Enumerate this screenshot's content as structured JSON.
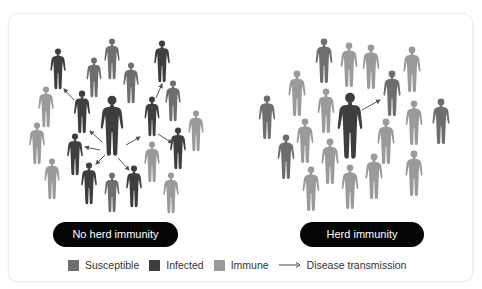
{
  "colors": {
    "susceptible": "#6e6e6e",
    "infected": "#3e3e3e",
    "immune": "#9a9a9a",
    "arrow": "#555555",
    "pill_bg": "#050505",
    "pill_text": "#ffffff"
  },
  "panels": [
    {
      "label": "No herd immunity",
      "figures": [
        {
          "x": 58,
          "y": 48,
          "h": 42,
          "type": "infected"
        },
        {
          "x": 94,
          "y": 57,
          "h": 41,
          "type": "susceptible"
        },
        {
          "x": 112,
          "y": 38,
          "h": 42,
          "type": "susceptible"
        },
        {
          "x": 131,
          "y": 62,
          "h": 42,
          "type": "susceptible"
        },
        {
          "x": 162,
          "y": 40,
          "h": 43,
          "type": "infected"
        },
        {
          "x": 173,
          "y": 80,
          "h": 42,
          "type": "susceptible"
        },
        {
          "x": 46,
          "y": 86,
          "h": 42,
          "type": "immune"
        },
        {
          "x": 82,
          "y": 90,
          "h": 44,
          "type": "infected"
        },
        {
          "x": 112,
          "y": 95,
          "h": 62,
          "type": "infected"
        },
        {
          "x": 152,
          "y": 96,
          "h": 41,
          "type": "infected"
        },
        {
          "x": 196,
          "y": 110,
          "h": 42,
          "type": "immune"
        },
        {
          "x": 37,
          "y": 122,
          "h": 43,
          "type": "immune"
        },
        {
          "x": 75,
          "y": 133,
          "h": 43,
          "type": "infected"
        },
        {
          "x": 178,
          "y": 127,
          "h": 43,
          "type": "infected"
        },
        {
          "x": 152,
          "y": 141,
          "h": 42,
          "type": "immune"
        },
        {
          "x": 52,
          "y": 158,
          "h": 42,
          "type": "immune"
        },
        {
          "x": 89,
          "y": 162,
          "h": 43,
          "type": "infected"
        },
        {
          "x": 112,
          "y": 172,
          "h": 41,
          "type": "susceptible"
        },
        {
          "x": 134,
          "y": 165,
          "h": 43,
          "type": "infected"
        },
        {
          "x": 171,
          "y": 172,
          "h": 42,
          "type": "immune"
        }
      ],
      "arrows": [
        {
          "x1": 74,
          "y1": 100,
          "x2": 64,
          "y2": 89
        },
        {
          "x1": 102,
          "y1": 142,
          "x2": 90,
          "y2": 131
        },
        {
          "x1": 100,
          "y1": 150,
          "x2": 85,
          "y2": 147
        },
        {
          "x1": 105,
          "y1": 155,
          "x2": 96,
          "y2": 164
        },
        {
          "x1": 118,
          "y1": 158,
          "x2": 129,
          "y2": 170
        },
        {
          "x1": 126,
          "y1": 145,
          "x2": 140,
          "y2": 137
        },
        {
          "x1": 156,
          "y1": 98,
          "x2": 162,
          "y2": 84
        },
        {
          "x1": 158,
          "y1": 134,
          "x2": 172,
          "y2": 143
        }
      ]
    },
    {
      "label": "Herd immunity",
      "figures": [
        {
          "x": 324,
          "y": 38,
          "h": 46,
          "type": "susceptible"
        },
        {
          "x": 349,
          "y": 42,
          "h": 46,
          "type": "immune"
        },
        {
          "x": 371,
          "y": 44,
          "h": 46,
          "type": "immune"
        },
        {
          "x": 412,
          "y": 46,
          "h": 47,
          "type": "immune"
        },
        {
          "x": 297,
          "y": 70,
          "h": 47,
          "type": "immune"
        },
        {
          "x": 392,
          "y": 70,
          "h": 47,
          "type": "susceptible"
        },
        {
          "x": 326,
          "y": 88,
          "h": 46,
          "type": "immune"
        },
        {
          "x": 350,
          "y": 92,
          "h": 68,
          "type": "infected"
        },
        {
          "x": 267,
          "y": 95,
          "h": 45,
          "type": "susceptible"
        },
        {
          "x": 414,
          "y": 100,
          "h": 46,
          "type": "immune"
        },
        {
          "x": 441,
          "y": 98,
          "h": 47,
          "type": "susceptible"
        },
        {
          "x": 305,
          "y": 118,
          "h": 46,
          "type": "immune"
        },
        {
          "x": 386,
          "y": 118,
          "h": 47,
          "type": "immune"
        },
        {
          "x": 286,
          "y": 134,
          "h": 46,
          "type": "susceptible"
        },
        {
          "x": 330,
          "y": 138,
          "h": 47,
          "type": "immune"
        },
        {
          "x": 374,
          "y": 153,
          "h": 47,
          "type": "immune"
        },
        {
          "x": 414,
          "y": 150,
          "h": 47,
          "type": "immune"
        },
        {
          "x": 311,
          "y": 166,
          "h": 46,
          "type": "immune"
        },
        {
          "x": 350,
          "y": 164,
          "h": 46,
          "type": "immune"
        }
      ],
      "arrows": [
        {
          "x1": 362,
          "y1": 110,
          "x2": 380,
          "y2": 100
        }
      ]
    }
  ],
  "legend": {
    "susceptible": "Susceptible",
    "infected": "Infected",
    "immune": "Immune",
    "transmission": "Disease transmission"
  }
}
